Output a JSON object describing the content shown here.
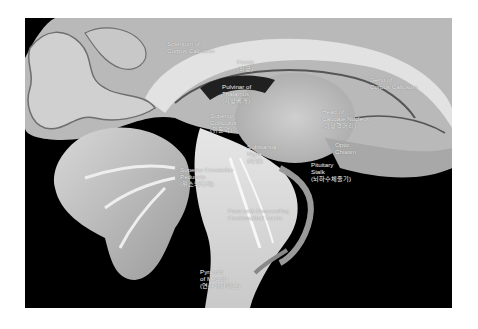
{
  "figure": {
    "background_color": "#000000",
    "page_color": "#ffffff"
  },
  "labels": [
    {
      "id": "splenium",
      "lines": [
        "Splenium of",
        "Corpus Callosum"
      ],
      "x": 142,
      "y": 22
    },
    {
      "id": "fornix",
      "lines": [
        "Fornix",
        "(뇌궁)"
      ],
      "x": 212,
      "y": 40
    },
    {
      "id": "pulvinar",
      "lines": [
        "Pulvinar of",
        "Thalamus",
        "(시상베개)"
      ],
      "x": 197,
      "y": 65
    },
    {
      "id": "genu",
      "lines": [
        "Genu of",
        "Corpus Callosum"
      ],
      "x": 345,
      "y": 58
    },
    {
      "id": "caudate",
      "lines": [
        "Head of",
        "Caudate Nucleus",
        "(미상핵머리)"
      ],
      "x": 297,
      "y": 90
    },
    {
      "id": "sup-colliculus",
      "lines": [
        "Superior",
        "Colliculus",
        "(위둔덕)"
      ],
      "x": 185,
      "y": 94
    },
    {
      "id": "substantia-nigra",
      "lines": [
        "Substantia",
        "Nigra",
        "(흑질)"
      ],
      "x": 222,
      "y": 125
    },
    {
      "id": "optic-chiasm",
      "lines": [
        "Optic",
        "Chiasm"
      ],
      "x": 310,
      "y": 123
    },
    {
      "id": "pituitary",
      "lines": [
        "Pituitary",
        "Stalk",
        "(뇌하수체줄기)"
      ],
      "x": 286,
      "y": 143
    },
    {
      "id": "sup-cereb-peduncle",
      "lines": [
        "Superior Cerebellar",
        "Peduncle",
        "(위소뇌다리)"
      ],
      "x": 155,
      "y": 148
    },
    {
      "id": "pons",
      "lines": [
        "Pons with Descending",
        "Corticospinal Tracts"
      ],
      "x": 203,
      "y": 189
    },
    {
      "id": "pyramid",
      "lines": [
        "Pyramid",
        "of Medulla",
        "(연수피라미드)"
      ],
      "x": 175,
      "y": 250
    }
  ]
}
